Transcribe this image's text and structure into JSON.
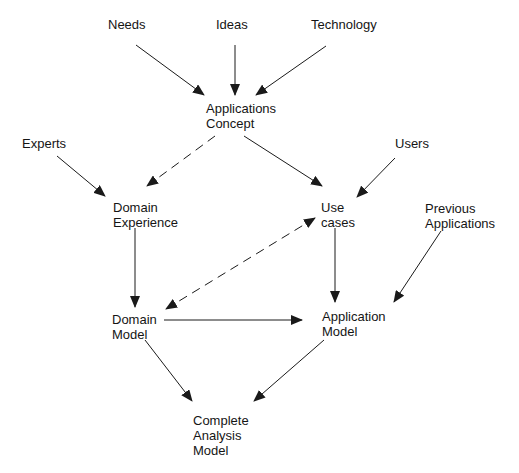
{
  "diagram": {
    "type": "flow",
    "nodes": [
      {
        "id": "needs",
        "label": "Needs"
      },
      {
        "id": "ideas",
        "label": "Ideas"
      },
      {
        "id": "technology",
        "label": "Technology"
      },
      {
        "id": "applications_concept",
        "label": "Applications\nConcept"
      },
      {
        "id": "experts",
        "label": "Experts"
      },
      {
        "id": "users",
        "label": "Users"
      },
      {
        "id": "domain_experience",
        "label": "Domain\nExperience"
      },
      {
        "id": "use_cases",
        "label": "Use\ncases"
      },
      {
        "id": "previous_applications",
        "label": "Previous\nApplications"
      },
      {
        "id": "domain_model",
        "label": "Domain\nModel"
      },
      {
        "id": "application_model",
        "label": "Application\nModel"
      },
      {
        "id": "complete_analysis_model",
        "label": "Complete\nAnalysis\nModel"
      }
    ],
    "edges": [
      {
        "from": "needs",
        "to": "applications_concept",
        "style": "solid"
      },
      {
        "from": "ideas",
        "to": "applications_concept",
        "style": "solid"
      },
      {
        "from": "technology",
        "to": "applications_concept",
        "style": "solid"
      },
      {
        "from": "applications_concept",
        "to": "domain_experience",
        "style": "dashed"
      },
      {
        "from": "applications_concept",
        "to": "use_cases",
        "style": "solid"
      },
      {
        "from": "experts",
        "to": "domain_experience",
        "style": "solid"
      },
      {
        "from": "users",
        "to": "use_cases",
        "style": "solid"
      },
      {
        "from": "domain_experience",
        "to": "domain_model",
        "style": "solid"
      },
      {
        "from": "use_cases",
        "to": "domain_model",
        "style": "dashed",
        "bidirectional": true
      },
      {
        "from": "use_cases",
        "to": "application_model",
        "style": "solid"
      },
      {
        "from": "previous_applications",
        "to": "application_model",
        "style": "solid"
      },
      {
        "from": "domain_model",
        "to": "application_model",
        "style": "solid"
      },
      {
        "from": "domain_model",
        "to": "complete_analysis_model",
        "style": "solid"
      },
      {
        "from": "application_model",
        "to": "complete_analysis_model",
        "style": "solid"
      }
    ]
  },
  "colors": {
    "line": "#1a1a1a",
    "background": "#ffffff"
  }
}
